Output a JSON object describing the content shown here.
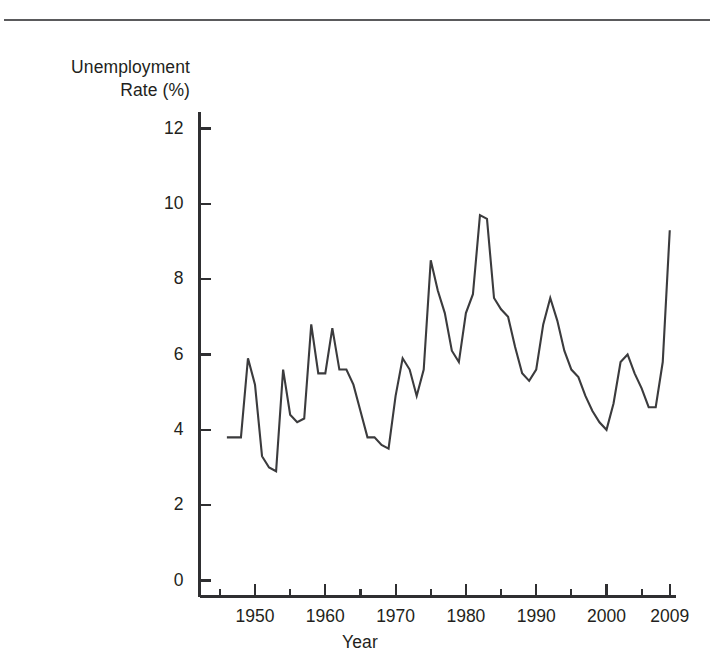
{
  "figure": {
    "y_axis_title": "Unemployment\nRate (%)",
    "x_axis_title": "Year"
  },
  "chart_data": {
    "type": "line",
    "title": "",
    "subtitle": "",
    "xlabel": "Year",
    "ylabel": "Unemployment Rate (%)",
    "xlim": [
      1942,
      2011
    ],
    "ylim": [
      0,
      13
    ],
    "grid": false,
    "legend": null,
    "y_ticks": [
      0,
      2,
      4,
      6,
      8,
      10,
      12
    ],
    "y_tick_labels": [
      "0",
      "2",
      "4",
      "6",
      "8",
      "10",
      "12"
    ],
    "x_ticks": [
      1950,
      1960,
      1970,
      1980,
      1990,
      2000,
      2009
    ],
    "x_tick_labels": [
      "1950",
      "1960",
      "1970",
      "1980",
      "1990",
      "2000",
      "2009"
    ],
    "x_minor_ticks": [
      1945,
      1955,
      1965,
      1975,
      1985,
      1995,
      2005
    ],
    "line_color": "#3b3b3d",
    "line_width": 2.1,
    "x": [
      1946,
      1947,
      1948,
      1949,
      1950,
      1951,
      1952,
      1953,
      1954,
      1955,
      1956,
      1957,
      1958,
      1959,
      1960,
      1961,
      1962,
      1963,
      1964,
      1965,
      1966,
      1967,
      1968,
      1969,
      1970,
      1971,
      1972,
      1973,
      1974,
      1975,
      1976,
      1977,
      1978,
      1979,
      1980,
      1981,
      1982,
      1983,
      1984,
      1985,
      1986,
      1987,
      1988,
      1989,
      1990,
      1991,
      1992,
      1993,
      1994,
      1995,
      1996,
      1997,
      1998,
      1999,
      2000,
      2001,
      2002,
      2003,
      2004,
      2005,
      2006,
      2007,
      2008,
      2009
    ],
    "values": [
      3.8,
      3.8,
      3.8,
      5.9,
      5.2,
      3.3,
      3.0,
      2.9,
      5.6,
      4.4,
      4.2,
      4.3,
      6.8,
      5.5,
      5.5,
      6.7,
      5.6,
      5.6,
      5.2,
      4.5,
      3.8,
      3.8,
      3.6,
      3.5,
      4.9,
      5.9,
      5.6,
      4.9,
      5.6,
      8.5,
      7.7,
      7.1,
      6.1,
      5.8,
      7.1,
      7.6,
      9.7,
      9.6,
      7.5,
      7.2,
      7.0,
      6.2,
      5.5,
      5.3,
      5.6,
      6.8,
      7.5,
      6.9,
      6.1,
      5.6,
      5.4,
      4.9,
      4.5,
      4.2,
      4.0,
      4.7,
      5.8,
      6.0,
      5.5,
      5.1,
      4.6,
      4.6,
      5.8,
      9.3
    ]
  }
}
